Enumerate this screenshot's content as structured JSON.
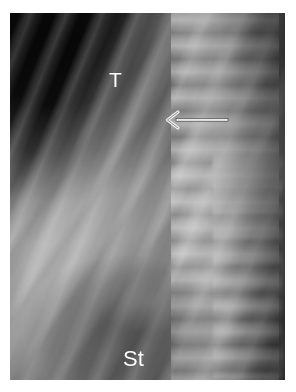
{
  "figure": {
    "kind": "radiograph",
    "modality": "x-ray",
    "view": "lateral thoracic / chest",
    "background_color": "#ffffff",
    "plate": {
      "x": 10,
      "y": 13,
      "width": 275,
      "height": 367,
      "base_color": "#7a7a7a",
      "dark_field_color": "#050505",
      "bright_bone_color": "#e8e8e8"
    }
  },
  "annotations": {
    "labels": [
      {
        "id": "thymus",
        "text": "T",
        "color": "#ffffff",
        "x": 99,
        "y": 56,
        "font_size": 21
      },
      {
        "id": "stomach",
        "text": "St",
        "color": "#ffffff",
        "x": 113,
        "y": 335,
        "font_size": 22
      }
    ],
    "arrow": {
      "id": "finding-arrow",
      "direction": "left",
      "style": "open-chevron-head",
      "color": "#f0f0f0",
      "outline_color": "#3a3a3a",
      "tail_x": 216,
      "head_x": 158,
      "y": 107
    }
  }
}
